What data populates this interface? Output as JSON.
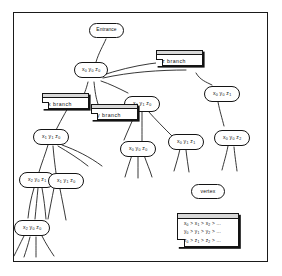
{
  "diagram": {
    "frame": {
      "border_color": "#1a1a1a"
    },
    "nodes": [
      {
        "id": "entrance",
        "label": "Entrance",
        "vars": null
      },
      {
        "id": "root",
        "label": "x0 y0 z0",
        "vars": [
          [
            "x",
            "0"
          ],
          [
            "y",
            "0"
          ],
          [
            "z",
            "0"
          ]
        ]
      },
      {
        "id": "n_x1",
        "label": "x1 y1 z0",
        "vars": [
          [
            "x",
            "1"
          ],
          [
            "y",
            "1"
          ],
          [
            "z",
            "0"
          ]
        ]
      },
      {
        "id": "n_x2",
        "label": "x2 y0 z1",
        "vars": [
          [
            "x",
            "2"
          ],
          [
            "y",
            "0"
          ],
          [
            "z",
            "1"
          ]
        ]
      },
      {
        "id": "n_x3",
        "label": "x1 y1 z0",
        "vars": [
          [
            "x",
            "1"
          ],
          [
            "y",
            "1"
          ],
          [
            "z",
            "0"
          ]
        ]
      },
      {
        "id": "n_x4",
        "label": "x2 y0 z0",
        "vars": [
          [
            "x",
            "2"
          ],
          [
            "y",
            "0"
          ],
          [
            "z",
            "0"
          ]
        ]
      },
      {
        "id": "n_mid",
        "label": "x0 y1 z0",
        "vars": [
          [
            "x",
            "0"
          ],
          [
            "y",
            "1"
          ],
          [
            "z",
            "0"
          ]
        ]
      },
      {
        "id": "n_mid2",
        "label": "x0 y0 z0",
        "vars": [
          [
            "x",
            "0"
          ],
          [
            "y",
            "0"
          ],
          [
            "z",
            "0"
          ]
        ]
      },
      {
        "id": "n_mid3",
        "label": "x0 y1 z1",
        "vars": [
          [
            "x",
            "0"
          ],
          [
            "y",
            "1"
          ],
          [
            "z",
            "1"
          ]
        ]
      },
      {
        "id": "n_right",
        "label": "x0 y0 z1",
        "vars": [
          [
            "x",
            "0"
          ],
          [
            "y",
            "0"
          ],
          [
            "z",
            "1"
          ]
        ]
      },
      {
        "id": "n_right2",
        "label": "x0 y0 z2",
        "vars": [
          [
            "x",
            "0"
          ],
          [
            "y",
            "0"
          ],
          [
            "z",
            "2"
          ]
        ]
      },
      {
        "id": "vertex",
        "label": "vertex",
        "vars": null
      }
    ],
    "notes": [
      {
        "id": "note-x",
        "label": "x branch"
      },
      {
        "id": "note-y",
        "label": "y branch"
      },
      {
        "id": "note-z",
        "label": "z branch"
      }
    ],
    "legend": {
      "rows": [
        {
          "var": "x",
          "text": "x0 > x1 > x2 > ..."
        },
        {
          "var": "y",
          "text": "y0 > y1 > y2 > ..."
        },
        {
          "var": "z",
          "text": "z0 > z1 > z2 > ..."
        }
      ]
    }
  }
}
